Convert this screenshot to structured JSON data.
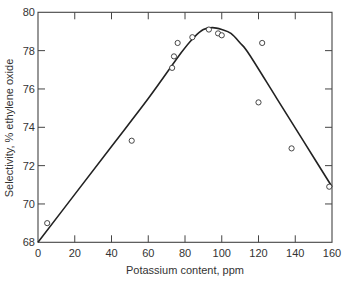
{
  "chart_data": {
    "type": "scatter",
    "title": "",
    "xlabel": "Potassium content, ppm",
    "ylabel": "Selectivity, % ethylene oxide",
    "xlim": [
      0,
      160
    ],
    "ylim": [
      68,
      80
    ],
    "xticks": [
      0,
      20,
      40,
      60,
      80,
      100,
      120,
      140,
      160
    ],
    "yticks": [
      68,
      70,
      72,
      74,
      76,
      78,
      80
    ],
    "xtick_labels": [
      "0",
      "20",
      "40",
      "60",
      "80",
      "100",
      "120",
      "140",
      "160"
    ],
    "ytick_labels": [
      "68",
      "70",
      "72",
      "74",
      "76",
      "78",
      "80"
    ],
    "grid": false,
    "legend": null,
    "series": [
      {
        "name": "Measured selectivity",
        "style": "open-circle markers",
        "points": [
          {
            "x": 5,
            "y": 69.0
          },
          {
            "x": 51,
            "y": 73.3
          },
          {
            "x": 73,
            "y": 77.1
          },
          {
            "x": 74,
            "y": 77.7
          },
          {
            "x": 76,
            "y": 78.4
          },
          {
            "x": 84,
            "y": 78.7
          },
          {
            "x": 93,
            "y": 79.1
          },
          {
            "x": 98,
            "y": 78.9
          },
          {
            "x": 100,
            "y": 78.8
          },
          {
            "x": 120,
            "y": 75.3
          },
          {
            "x": 122,
            "y": 78.4
          },
          {
            "x": 138,
            "y": 72.9
          },
          {
            "x": 158.5,
            "y": 70.9
          }
        ]
      },
      {
        "name": "Fitted trend",
        "style": "solid line",
        "points": [
          {
            "x": 0,
            "y": 68.0
          },
          {
            "x": 20,
            "y": 70.5
          },
          {
            "x": 40,
            "y": 73.0
          },
          {
            "x": 60,
            "y": 75.5
          },
          {
            "x": 78,
            "y": 77.9
          },
          {
            "x": 85,
            "y": 78.7
          },
          {
            "x": 90,
            "y": 79.1
          },
          {
            "x": 95,
            "y": 79.2
          },
          {
            "x": 100,
            "y": 79.1
          },
          {
            "x": 105,
            "y": 78.9
          },
          {
            "x": 110,
            "y": 78.4
          },
          {
            "x": 115,
            "y": 77.8
          },
          {
            "x": 130,
            "y": 75.5
          },
          {
            "x": 145,
            "y": 73.2
          },
          {
            "x": 160,
            "y": 70.9
          }
        ]
      }
    ]
  }
}
